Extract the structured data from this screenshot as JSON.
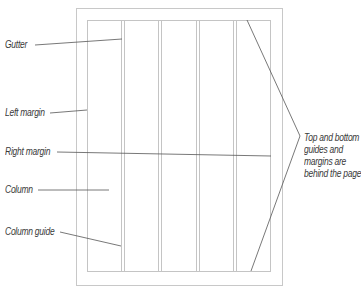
{
  "diagram": {
    "colors": {
      "page_border": "#c8c8c8",
      "guide_line": "#c4c4c4",
      "leader_line": "#555555",
      "label_text": "#3a3a3a"
    },
    "page": {
      "outer": {
        "x": 76,
        "y": 8,
        "width": 207,
        "height": 278
      },
      "margin_box": {
        "x": 87,
        "y": 20,
        "width": 184,
        "height": 252
      }
    },
    "column_guides_x": [
      121,
      124,
      158,
      161,
      196,
      199,
      233,
      236
    ],
    "labels": {
      "gutter": "Gutter",
      "left_margin": "Left margin",
      "right_margin": "Right margin",
      "column": "Column",
      "column_guide": "Column guide",
      "top_bottom_note": [
        "Top and bottom",
        "guides and",
        "margins are",
        "behind the page"
      ]
    }
  }
}
